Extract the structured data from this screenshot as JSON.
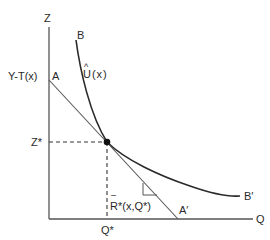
{
  "diagram": {
    "axes": {
      "y_label": "Z",
      "x_label": "Q"
    },
    "curve": {
      "start_label": "B",
      "end_label": "B′",
      "name_label": "U(x)",
      "hat": "^"
    },
    "budget_line": {
      "start_label": "A",
      "end_label": "A′",
      "intercept_label": "Y-T(x)"
    },
    "tangency": {
      "z_label": "Z*",
      "q_label": "Q*",
      "slope_label": "R*(x,Q*)",
      "slope_bar": "–"
    },
    "colors": {
      "ink": "#2a2a2a",
      "line": "#555555",
      "background": "#ffffff"
    }
  }
}
